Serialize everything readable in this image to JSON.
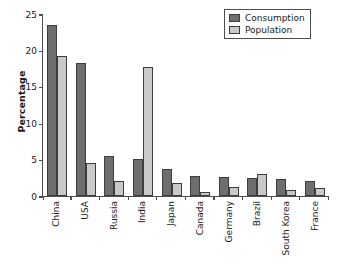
{
  "chart_data": {
    "type": "bar",
    "title": "",
    "subtitle": "",
    "xlabel": "",
    "ylabel": "Percentage",
    "ylim": [
      0,
      25
    ],
    "yticks": [
      0,
      5,
      10,
      15,
      20,
      25
    ],
    "grid": false,
    "legend_position": "top-right",
    "categories": [
      "China",
      "USA",
      "Russia",
      "India",
      "Japan",
      "Canada",
      "Germany",
      "Brazil",
      "South Korea",
      "France"
    ],
    "series": [
      {
        "name": "Consumption",
        "color": "#6e6e6e",
        "values": [
          23.5,
          18.3,
          5.5,
          5.1,
          3.7,
          2.7,
          2.6,
          2.5,
          2.3,
          2.0
        ]
      },
      {
        "name": "Population",
        "color": "#c9c9c9",
        "values": [
          19.3,
          4.6,
          2.1,
          17.7,
          1.8,
          0.5,
          1.2,
          3.0,
          0.8,
          1.1
        ]
      }
    ]
  },
  "axis": {
    "y_label": "Percentage",
    "y_tick_labels": [
      "25",
      "20",
      "15",
      "10",
      "5",
      "0"
    ]
  },
  "legend": {
    "items": [
      {
        "label": "Consumption",
        "color": "#6e6e6e"
      },
      {
        "label": "Population",
        "color": "#c9c9c9"
      }
    ]
  },
  "colors": {
    "consumption": "#6e6e6e",
    "population": "#c9c9c9",
    "axis": "#4d4d4d",
    "text": "#1a1a1a",
    "background": "#ffffff"
  }
}
